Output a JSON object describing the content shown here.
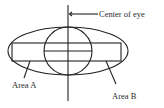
{
  "diagram": {
    "labels": {
      "center": "Center of eye",
      "area_a": "Area A",
      "area_b": "Area B"
    },
    "colors": {
      "stroke": "#222222",
      "text": "#2a2a2a",
      "background": "#ffffff"
    }
  }
}
